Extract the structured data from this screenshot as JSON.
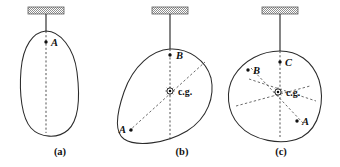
{
  "figure": {
    "background_color": "#ffffff",
    "ink_color": "#2b2b2b",
    "dashed_color": "#5a5a5a",
    "ceiling_color": "#9a9a9a",
    "panels": [
      {
        "id": "a",
        "caption": "(a)",
        "caption_x": 60,
        "caption_y": 155,
        "ceiling": {
          "x": 28,
          "y": 7,
          "width": 36,
          "height": 7
        },
        "rod": {
          "x1": 46,
          "y1": 14,
          "x2": 46,
          "y2": 31
        },
        "body_outline": "M 46 31 C 33 32 23 46 21 70 C 19 94 22 118 31 128 C 40 138 58 139 68 130 C 79 120 80 96 77 72 C 74 48 60 31 46 31 Z",
        "plumb_lines": [
          {
            "x1": 46,
            "y1": 31,
            "x2": 46,
            "y2": 133
          }
        ],
        "rays": [],
        "points": [
          {
            "label": "A",
            "x": 46,
            "y": 42,
            "label_x": 51,
            "label_y": 45.5,
            "anchor": "start"
          }
        ],
        "cg": null
      },
      {
        "id": "b",
        "caption": "(b)",
        "caption_x": 182,
        "caption_y": 155,
        "ceiling": {
          "x": 152,
          "y": 7,
          "width": 36,
          "height": 7
        },
        "rod": {
          "x1": 170,
          "y1": 14,
          "x2": 170,
          "y2": 49
        },
        "body_outline": "M 170 49 C 152 50 133 66 124 92 C 116 115 114 132 124 139 C 136 147 165 144 187 131 C 208 118 215 96 211 78 C 206 60 188 48 170 49 Z",
        "plumb_lines": [
          {
            "x1": 170,
            "y1": 49,
            "x2": 170,
            "y2": 140
          }
        ],
        "rays": [
          {
            "x1": 129,
            "y1": 131,
            "x2": 205,
            "y2": 62
          }
        ],
        "points": [
          {
            "label": "B",
            "x": 170,
            "y": 55,
            "label_x": 176,
            "label_y": 59,
            "anchor": "start"
          },
          {
            "label": "A",
            "x": 131,
            "y": 130,
            "label_x": 126,
            "label_y": 133,
            "anchor": "end"
          }
        ],
        "cg": {
          "x": 170,
          "y": 91,
          "label": "c.g.",
          "label_x": 178,
          "label_y": 94.5
        }
      },
      {
        "id": "c",
        "caption": "(c)",
        "caption_x": 281,
        "caption_y": 155,
        "ceiling": {
          "x": 262,
          "y": 7,
          "width": 36,
          "height": 7
        },
        "rod": {
          "x1": 280,
          "y1": 14,
          "x2": 280,
          "y2": 51
        },
        "body_outline": "M 280 51 C 262 51 244 60 234 76 C 225 91 227 112 239 125 C 252 140 282 147 302 137 C 320 127 325 100 319 80 C 312 60 297 51 280 51 Z",
        "plumb_lines": [
          {
            "x1": 280,
            "y1": 51,
            "x2": 280,
            "y2": 137
          }
        ],
        "rays": [
          {
            "x1": 251,
            "y1": 68,
            "x2": 303,
            "y2": 123
          },
          {
            "x1": 249,
            "y1": 79,
            "x2": 316,
            "y2": 101
          },
          {
            "x1": 236,
            "y1": 106,
            "x2": 310,
            "y2": 86
          }
        ],
        "points": [
          {
            "label": "C",
            "x": 280,
            "y": 62,
            "label_x": 285,
            "label_y": 66,
            "anchor": "start"
          },
          {
            "label": "B",
            "x": 248,
            "y": 70,
            "label_x": 253,
            "label_y": 74,
            "anchor": "start"
          },
          {
            "label": "A",
            "x": 297,
            "y": 121,
            "label_x": 302,
            "label_y": 125,
            "anchor": "start"
          }
        ],
        "cg": {
          "x": 278,
          "y": 92,
          "label": "c.g.",
          "label_x": 286,
          "label_y": 95.5
        }
      }
    ]
  }
}
